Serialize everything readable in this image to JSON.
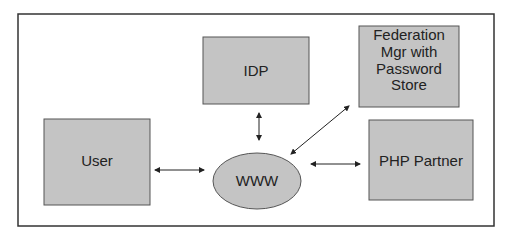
{
  "diagram": {
    "nodes": [
      {
        "id": "idp",
        "label": [
          "IDP"
        ],
        "shape": "rect"
      },
      {
        "id": "federation",
        "label": [
          "Federation",
          "Mgr with",
          "Password",
          "Store"
        ],
        "shape": "rect"
      },
      {
        "id": "user",
        "label": [
          "User"
        ],
        "shape": "rect"
      },
      {
        "id": "www",
        "label": [
          "WWW"
        ],
        "shape": "ellipse"
      },
      {
        "id": "php",
        "label": [
          "PHP Partner"
        ],
        "shape": "rect"
      }
    ],
    "edges": [
      {
        "from": "user",
        "to": "www",
        "bidirectional": true
      },
      {
        "from": "idp",
        "to": "www",
        "bidirectional": true
      },
      {
        "from": "federation",
        "to": "www",
        "bidirectional": true
      },
      {
        "from": "www",
        "to": "php",
        "bidirectional": true
      }
    ],
    "colors": {
      "node_fill": "#c4c4c4",
      "stroke": "#3a3a3a",
      "background": "#ffffff"
    }
  }
}
